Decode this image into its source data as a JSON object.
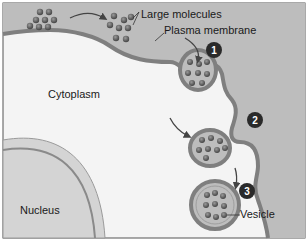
{
  "labels": {
    "large_molecules": "Large molecules",
    "plasma_membrane": "Plasma membrane",
    "cytoplasm": "Cytoplasm",
    "nucleus": "Nucleus",
    "vesicle": "Vesicle"
  },
  "steps": [
    "1",
    "2",
    "3"
  ],
  "colors": {
    "extracellular": "#bdbdbd",
    "membrane": "#7f7f7f",
    "cytoplasm": "#f4f4f4",
    "nucleus": "#d4d4d4",
    "molecule": "#5a5a5a",
    "step_badge": "#2a2a2a"
  }
}
